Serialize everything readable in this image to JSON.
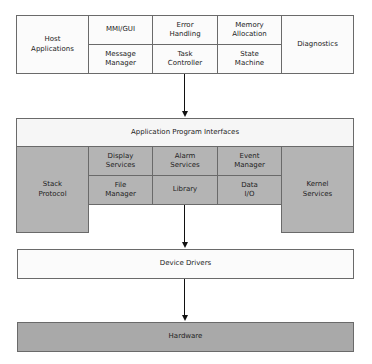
{
  "diagram": {
    "top_layer": {
      "host": "Host\nApplications",
      "cells": [
        {
          "id": "mmi",
          "label": "MMI/GUI"
        },
        {
          "id": "error",
          "label": "Error\nHandling"
        },
        {
          "id": "memory",
          "label": "Memory\nAllocation"
        },
        {
          "id": "message",
          "label": "Message\nManager"
        },
        {
          "id": "task",
          "label": "Task\nController"
        },
        {
          "id": "state",
          "label": "State\nMachine"
        }
      ],
      "diagnostics": "Diagnostics"
    },
    "api_layer": {
      "title": "Application Program Interfaces",
      "left": "Stack\nProtocol",
      "right": "Kernel\nServices",
      "cells": [
        {
          "id": "display",
          "label": "Display\nServices"
        },
        {
          "id": "alarm",
          "label": "Alarm\nServices"
        },
        {
          "id": "event",
          "label": "Event\nManager"
        },
        {
          "id": "file",
          "label": "File\nManager"
        },
        {
          "id": "library",
          "label": "Library"
        },
        {
          "id": "data",
          "label": "Data\nI/O"
        }
      ]
    },
    "drivers": "Device Drivers",
    "hardware": "Hardware",
    "colors": {
      "white_fill": "#fbfbfb",
      "gray_fill": "#b4b4b4",
      "hardware_fill": "#a9a9a9",
      "border": "#6a6a6a",
      "arrow": "#111111"
    }
  }
}
